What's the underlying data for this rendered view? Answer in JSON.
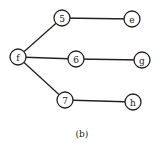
{
  "diagram": {
    "type": "tree",
    "caption": "(b)",
    "nodes": [
      {
        "id": "f",
        "label": "f",
        "x": 18,
        "y": 57
      },
      {
        "id": "5",
        "label": "5",
        "x": 62,
        "y": 18
      },
      {
        "id": "6",
        "label": "6",
        "x": 76,
        "y": 59
      },
      {
        "id": "7",
        "label": "7",
        "x": 65,
        "y": 100
      },
      {
        "id": "e",
        "label": "e",
        "x": 132,
        "y": 19
      },
      {
        "id": "g",
        "label": "g",
        "x": 142,
        "y": 60
      },
      {
        "id": "h",
        "label": "h",
        "x": 133,
        "y": 102
      }
    ],
    "edges": [
      {
        "from": "f",
        "to": "5"
      },
      {
        "from": "f",
        "to": "6"
      },
      {
        "from": "f",
        "to": "7"
      },
      {
        "from": "5",
        "to": "e"
      },
      {
        "from": "6",
        "to": "g"
      },
      {
        "from": "7",
        "to": "h"
      }
    ],
    "node_radius": 8,
    "stroke_color": "#222222",
    "background": "#ffffff"
  }
}
